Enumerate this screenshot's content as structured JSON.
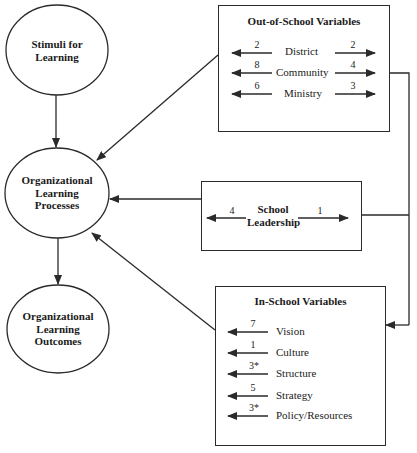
{
  "diagram": {
    "nodes": {
      "stimuli": {
        "line1": "Stimuli for",
        "line2": "Learning"
      },
      "processes": {
        "line1": "Organizational",
        "line2": "Learning",
        "line3": "Processes"
      },
      "outcomes": {
        "line1": "Organizational",
        "line2": "Learning",
        "line3": "Outcomes"
      }
    },
    "out_of_school": {
      "title": "Out-of-School Variables",
      "rows": [
        {
          "label": "District",
          "left": "2",
          "right": "2"
        },
        {
          "label": "Community",
          "left": "8",
          "right": "4"
        },
        {
          "label": "Ministry",
          "left": "6",
          "right": "3"
        }
      ]
    },
    "school_leadership": {
      "line1": "School",
      "line2": "Leadership",
      "left": "4",
      "right": "1"
    },
    "in_school": {
      "title": "In-School Variables",
      "rows": [
        {
          "label": "Vision",
          "value": "7"
        },
        {
          "label": "Culture",
          "value": "1"
        },
        {
          "label": "Structure",
          "value": "3*"
        },
        {
          "label": "Strategy",
          "value": "5"
        },
        {
          "label": "Policy/Resources",
          "value": "3*"
        }
      ]
    },
    "colors": {
      "line": "#2a2a2a",
      "background": "#ffffff"
    }
  }
}
